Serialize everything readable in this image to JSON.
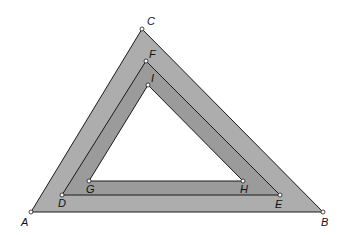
{
  "diagram": {
    "type": "nested-triangles",
    "colors": {
      "outer_band": "#adadad",
      "inner_band": "#9b9b9b",
      "center": "#ffffff",
      "stroke": "#1a1a1a"
    },
    "triangles": {
      "outer": [
        "A",
        "B",
        "C"
      ],
      "middle": [
        "D",
        "E",
        "F"
      ],
      "inner": [
        "G",
        "H",
        "I"
      ]
    },
    "points": {
      "A": {
        "label": "A",
        "x": 31,
        "y": 212
      },
      "B": {
        "label": "B",
        "x": 323,
        "y": 212
      },
      "C": {
        "label": "C",
        "x": 142,
        "y": 29
      },
      "D": {
        "label": "D",
        "x": 62,
        "y": 195
      },
      "E": {
        "label": "E",
        "x": 280,
        "y": 195
      },
      "F": {
        "label": "F",
        "x": 146,
        "y": 61
      },
      "G": {
        "label": "G",
        "x": 89,
        "y": 181
      },
      "H": {
        "label": "H",
        "x": 243,
        "y": 181
      },
      "I": {
        "label": "I",
        "x": 148,
        "y": 85
      }
    }
  }
}
